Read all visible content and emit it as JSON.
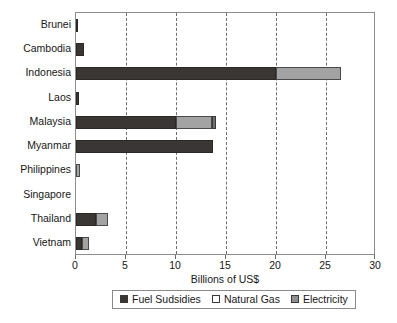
{
  "chart_data": {
    "type": "bar",
    "orientation": "horizontal",
    "stacked": true,
    "title": "",
    "xlabel": "Billions of US$",
    "ylabel": "",
    "xlim": [
      0,
      30
    ],
    "xticks": [
      0,
      5,
      10,
      15,
      20,
      25,
      30
    ],
    "xtick_labels": [
      "0",
      "5",
      "10",
      "15",
      "20",
      "25",
      "30"
    ],
    "grid": "vertical-dashed",
    "legend_position": "bottom",
    "categories": [
      "Brunei",
      "Cambodia",
      "Indonesia",
      "Laos",
      "Malaysia",
      "Myanmar",
      "Philippines",
      "Singapore",
      "Thailand",
      "Vietnam"
    ],
    "series": [
      {
        "name": "Fuel Sudsidies",
        "color": "#3a3634",
        "values": [
          0.15,
          0.8,
          20.0,
          0.3,
          10.0,
          13.7,
          0.0,
          0.0,
          2.0,
          0.6
        ]
      },
      {
        "name": "Natural Gas",
        "color": "#a3a3a3",
        "values": [
          0.0,
          0.0,
          6.5,
          0.0,
          3.6,
          0.0,
          0.35,
          0.0,
          1.2,
          0.65
        ]
      },
      {
        "name": "Electricity",
        "color": "#6f6f6f",
        "values": [
          0.0,
          0.0,
          0.0,
          0.0,
          0.4,
          0.0,
          0.0,
          0.0,
          0.0,
          0.0
        ]
      }
    ]
  },
  "legend": {
    "items": [
      {
        "label": "Fuel Sudsidies",
        "swatch": "fuel"
      },
      {
        "label": "Natural Gas",
        "swatch": "gas"
      },
      {
        "label": "Electricity",
        "swatch": "elec"
      }
    ]
  },
  "colors": {
    "fuel_subsidies": "#3a3634",
    "natural_gas": "#a3a3a3",
    "electricity": "#6f6f6f",
    "grid": "#6e6e6e",
    "frame": "#8d8d8d",
    "background": "#ffffff",
    "text": "#171717"
  }
}
